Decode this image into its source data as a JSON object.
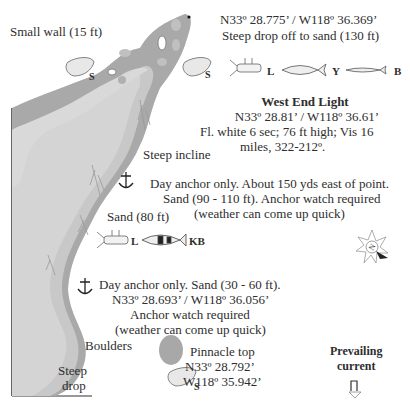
{
  "map": {
    "colors": {
      "reef_dark": "#a9a9a9",
      "reef_light": "#d4d4d4",
      "rock": "#bdbdbd",
      "border": "#333333",
      "text": "#2e2e2e"
    },
    "labels": {
      "small_wall": "Small wall (15 ft)",
      "top_coord": "N33º 28.775’ / W118º 36.369’",
      "top_drop": "Steep drop off to sand (130 ft)",
      "light_title": "West End Light",
      "light_coord": "N33º 28.81’ / W118º 36.61’",
      "light_desc1": "Fl. white 6 sec; 76 ft high; Vis 16",
      "light_desc2": "miles, 322-212º.",
      "steep_incline": "Steep incline",
      "anchor1_line1": "Day anchor only. About 150 yds east of point.",
      "anchor1_line2": "Sand (90 - 110 ft). Anchor watch required",
      "anchor1_line3": "(weather can come up quick)",
      "sand_80": "Sand (80 ft)",
      "anchor2_line1": "Day anchor only. Sand (30 - 60 ft).",
      "anchor2_line2": "N33º 28.693’ / W118º 36.056’",
      "anchor2_line3": "Anchor watch required",
      "anchor2_line4": "(weather can come up quick)",
      "boulders": "Boulders",
      "steep_drop1": "Steep",
      "steep_drop2": "drop",
      "pinnacle_title": "Pinnacle top",
      "pinnacle_lat": "N33º 28.792’",
      "pinnacle_lon": "W118º 35.942’",
      "current1": "Prevailing",
      "current2": "current"
    },
    "species_codes": {
      "scallop": "S",
      "lobster": "L",
      "yellowtail": "Y",
      "barracuda": "B",
      "kelp_bass": "KB"
    },
    "icons": [
      "scallop-icon",
      "lobster-icon",
      "yellowtail-fish-icon",
      "barracuda-fish-icon",
      "kelp-bass-fish-icon",
      "anchor-icon",
      "compass-rose-icon",
      "current-arrow-icon",
      "kelp-icon"
    ]
  }
}
